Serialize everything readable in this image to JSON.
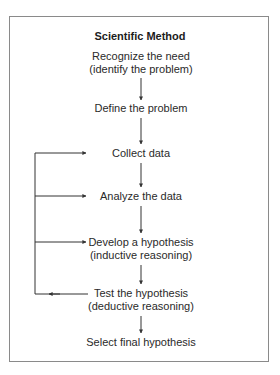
{
  "diagram": {
    "title": "Scientific Method",
    "steps": [
      {
        "line1": "Recognize the need",
        "line2": "(identify the problem)"
      },
      {
        "line1": "Define the problem"
      },
      {
        "line1": "Collect data"
      },
      {
        "line1": "Analyze the data"
      },
      {
        "line1": "Develop a hypothesis",
        "line2": "(inductive reasoning)"
      },
      {
        "line1": "Test the hypothesis",
        "line2": "(deductive reasoning)"
      },
      {
        "line1": "Select final hypothesis"
      }
    ],
    "feedback_loop": {
      "from": "Test the hypothesis",
      "to": [
        "Collect data",
        "Analyze the data",
        "Develop a hypothesis"
      ]
    },
    "colors": {
      "line": "#333333",
      "border": "#8a8a8a",
      "text": "#2a2a2a"
    }
  }
}
